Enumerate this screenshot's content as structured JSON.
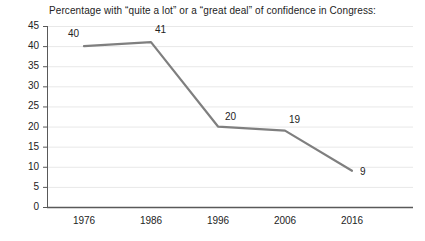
{
  "chart_data": {
    "type": "line",
    "title": "Percentage with “quite a lot” or a “great deal” of confidence in Congress:",
    "xlabel": "",
    "ylabel": "",
    "categories": [
      "1976",
      "1986",
      "1996",
      "2006",
      "2016"
    ],
    "values": [
      40,
      41,
      20,
      19,
      9
    ],
    "point_labels": [
      "40",
      "41",
      "20",
      "19",
      "9"
    ],
    "ylim": [
      0,
      45
    ],
    "yticks": [
      "0",
      "5",
      "10",
      "15",
      "20",
      "25",
      "30",
      "35",
      "40",
      "45"
    ],
    "grid": true,
    "legend": "none",
    "series": [
      {
        "name": "Confidence in Congress",
        "values": [
          40,
          41,
          20,
          19,
          9
        ]
      }
    ],
    "colors": {
      "line": "#7f7f7f",
      "grid": "#e8e8e8",
      "axis": "#595959",
      "text": "#232323",
      "background": "#ffffff"
    }
  }
}
